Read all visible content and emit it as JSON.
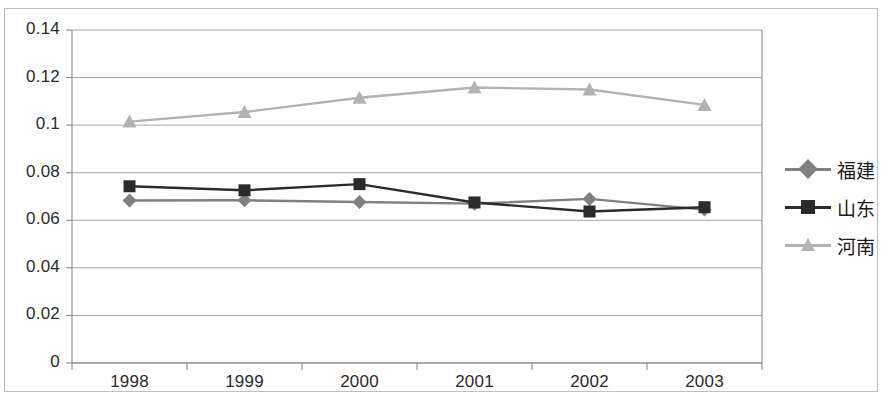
{
  "chart_data": {
    "type": "line",
    "title": "",
    "xlabel": "",
    "ylabel": "",
    "categories": [
      "1998",
      "1999",
      "2000",
      "2001",
      "2002",
      "2003"
    ],
    "x_tick_labels": [
      "1998",
      "1999",
      "2000",
      "2001",
      "2002",
      "2003"
    ],
    "y_tick_labels": [
      "0.14",
      "0.12",
      "0.1",
      "0.08",
      "0.06",
      "0.04",
      "0.02",
      "0"
    ],
    "y_ticks": [
      0.14,
      0.12,
      0.1,
      0.08,
      0.06,
      0.04,
      0.02,
      0
    ],
    "ylim": [
      0,
      0.14
    ],
    "grid": "horizontal",
    "legend_position": "right",
    "series": [
      {
        "name": "福建",
        "marker": "diamond",
        "color": "#808080",
        "values": [
          0.0683,
          0.0684,
          0.0677,
          0.067,
          0.069,
          0.0645
        ]
      },
      {
        "name": "山东",
        "marker": "square",
        "color": "#2b2b2b",
        "values": [
          0.0743,
          0.0726,
          0.0752,
          0.0675,
          0.0637,
          0.0655
        ]
      },
      {
        "name": "河南",
        "marker": "triangle",
        "color": "#b3b3b3",
        "values": [
          0.1015,
          0.1055,
          0.1115,
          0.1158,
          0.115,
          0.1085
        ]
      }
    ]
  },
  "legend": {
    "items": [
      {
        "label": "福建"
      },
      {
        "label": "山东"
      },
      {
        "label": "河南"
      }
    ]
  },
  "axes": {
    "y_labels": [
      "0.14",
      "0.12",
      "0.1",
      "0.08",
      "0.06",
      "0.04",
      "0.02",
      "0"
    ],
    "x_labels": [
      "1998",
      "1999",
      "2000",
      "2001",
      "2002",
      "2003"
    ]
  },
  "colors": {
    "series_fujian": "#808080",
    "series_shandong": "#2b2b2b",
    "series_henan": "#b3b3b3",
    "grid": "#a6a6a6",
    "axis": "#808080",
    "border": "#bfbfbf",
    "text": "#2b2b2b"
  }
}
